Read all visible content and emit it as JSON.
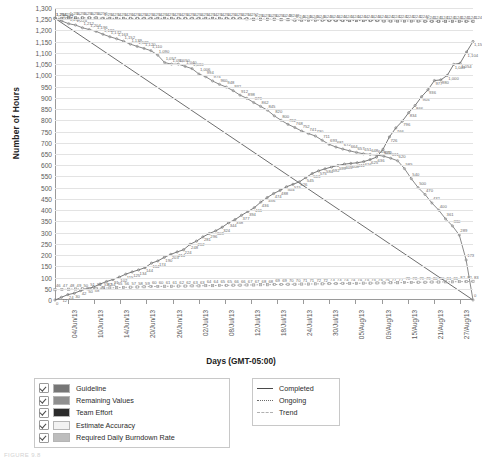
{
  "chart_data": {
    "type": "line",
    "title": "",
    "xlabel": "Days (GMT-05:00)",
    "ylabel": "Number of Hours",
    "ylim": [
      0,
      1300
    ],
    "ytick_step": 50,
    "grid": true,
    "legend_position": "bottom",
    "ytick_labels": [
      "1,300",
      "1,250",
      "1,200",
      "1,150",
      "1,100",
      "1,050",
      "1,000",
      "950",
      "900",
      "850",
      "800",
      "750",
      "700",
      "650",
      "600",
      "550",
      "500",
      "450",
      "400",
      "350",
      "300",
      "250",
      "200",
      "150",
      "100",
      "50",
      "0"
    ],
    "xtick_labels": [
      "04/Jun/13",
      "10/Jun/13",
      "14/Jun/13",
      "20/Jun/13",
      "26/Jun/13",
      "02/Jul/13",
      "08/Jul/13",
      "12/Jul/13",
      "18/Jul/13",
      "24/Jul/13",
      "30/Jul/13",
      "05/Aug/13",
      "09/Aug/13",
      "15/Aug/13",
      "21/Aug/13",
      "27/Aug/13"
    ],
    "x_count": 62,
    "series": [
      {
        "name": "Team Effort",
        "style": "dotted",
        "color": "#7a7a7a",
        "values": [
          1254,
          1254,
          1256,
          1256,
          1256,
          1256,
          1256,
          1254,
          1254,
          1254,
          1254,
          1254,
          1254,
          1254,
          1254,
          1254,
          1254,
          1254,
          1254,
          1254,
          1254,
          1254,
          1254,
          1254,
          1254,
          1254,
          1254,
          1254,
          1252,
          1250,
          1250,
          1250,
          1250,
          1248,
          1248,
          1246,
          1246,
          1246,
          1246,
          1246,
          1244,
          1244,
          1244,
          1244,
          1244,
          1244,
          1244,
          1244,
          1242,
          1242,
          1242,
          1242,
          1242,
          1242,
          1241,
          1241,
          1241,
          1241,
          1241,
          1241,
          1241,
          1241
        ],
        "labels_sample": [
          "1,254",
          "1,256",
          "1,250",
          "1,246",
          "1,244",
          "1,241"
        ]
      },
      {
        "name": "Remaining Values",
        "style": "solid",
        "color": "#8a8a8a",
        "values": [
          1254,
          1242,
          1230,
          1224,
          1212,
          1204,
          1196,
          1183,
          1172,
          1163,
          1152,
          1139,
          1129,
          1120,
          1110,
          1090,
          1057,
          1050,
          1050,
          1040,
          1030,
          1006,
          994,
          975,
          960,
          948,
          932,
          912,
          898,
          879,
          862,
          845,
          820,
          800,
          782,
          768,
          752,
          741,
          730,
          711,
          693,
          681,
          672,
          664,
          657,
          651,
          648,
          645,
          640,
          631,
          620,
          585,
          540,
          500,
          470,
          432,
          400,
          361,
          330,
          289,
          178,
          0
        ],
        "labels_sample": [
          "1,254",
          "1,129",
          "1,057",
          "1,040",
          "1,006",
          "879",
          "782",
          "711",
          "693",
          "672",
          "657",
          "651",
          "648",
          "645",
          "620",
          "0"
        ]
      },
      {
        "name": "Completed",
        "style": "solid",
        "color": "#7a7a7a",
        "values": [
          0,
          12,
          24,
          30,
          42,
          50,
          58,
          71,
          82,
          91,
          102,
          115,
          125,
          134,
          144,
          164,
          174,
          190,
          203,
          214,
          224,
          248,
          262,
          281,
          296,
          308,
          324,
          344,
          358,
          377,
          394,
          411,
          436,
          456,
          474,
          488,
          504,
          515,
          526,
          545,
          563,
          575,
          584,
          592,
          599,
          605,
          608,
          611,
          616,
          625,
          636,
          671,
          726,
          766,
          796,
          834,
          866,
          905,
          936,
          977,
          980,
          1000,
          1049,
          1054,
          1104,
          1151
        ],
        "labels_sample": [
          "0",
          "174",
          "296",
          "436",
          "504",
          "545",
          "584",
          "605",
          "616",
          "636",
          "726",
          "980",
          "1,000",
          "1,049",
          "1,054",
          "1,104",
          "1,151"
        ]
      },
      {
        "name": "Required Daily Burndown Rate",
        "style": "dotted-flat",
        "color": "#9e9e9e",
        "values": [
          46,
          47,
          48,
          49,
          50,
          51,
          52,
          53,
          54,
          55,
          56,
          57,
          58,
          59,
          60,
          60,
          61,
          61,
          62,
          62,
          63,
          63,
          64,
          64,
          65,
          65,
          66,
          66,
          67,
          67,
          68,
          68,
          69,
          69,
          70,
          70,
          71,
          71,
          72,
          72,
          73,
          73,
          74,
          74,
          74,
          75,
          75,
          76,
          76,
          77,
          77,
          78,
          78,
          79,
          79,
          80,
          80,
          81,
          81,
          82,
          82,
          83
        ],
        "labels_sample": [
          "46",
          "55",
          "62",
          "68",
          "74",
          "79",
          "83"
        ]
      },
      {
        "name": "Guideline",
        "style": "trend",
        "color": "#6e6e6e",
        "values": [
          1254,
          0
        ],
        "description": "Straight guideline from 1,254 hours on 04/Jun/13 down to 0 on 29/Aug/13"
      }
    ],
    "annotations": {
      "top_right_team_effort": "1,241",
      "top_right_completed": "1,151",
      "end_remaining": "0",
      "crossover_value": "620",
      "crossover_date": "18/Jul/13"
    }
  },
  "legend_left": {
    "items": [
      {
        "label": "Guideline",
        "color": "#767676",
        "checked": true
      },
      {
        "label": "Remaining Values",
        "color": "#8f8f8f",
        "checked": true
      },
      {
        "label": "Team Effort",
        "color": "#2b2b2b",
        "checked": true
      },
      {
        "label": "Estimate Accuracy",
        "color": "#f2f2f2",
        "checked": true
      },
      {
        "label": "Required Daily Burndown Rate",
        "color": "#bdbdbd",
        "checked": true
      }
    ]
  },
  "legend_right": {
    "items": [
      {
        "label": "Completed",
        "style": "solid"
      },
      {
        "label": "Ongoing",
        "style": "dotted"
      },
      {
        "label": "Trend",
        "style": "dashed"
      }
    ]
  },
  "caption": "FIGURE 9.8"
}
